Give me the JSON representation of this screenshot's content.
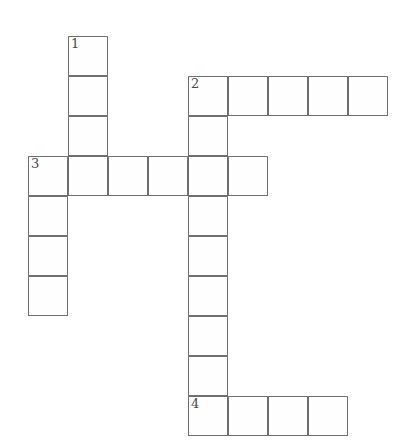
{
  "puzzle": {
    "title": "Crossword Puzzle Grid",
    "grid": {
      "cell_size": 40,
      "origin_x": 28,
      "origin_y": 36,
      "columns": 10,
      "rows": 10,
      "line_color": "#6f6f6f",
      "cell_fill": "#fefefe",
      "number_color": "#4a4a4a",
      "background": "#ffffff"
    },
    "entries": [
      {
        "number": "1",
        "direction": "down",
        "start_col": 1,
        "start_row": 0,
        "length": 4,
        "label": "1 Down"
      },
      {
        "number": "2",
        "direction": "across",
        "start_col": 4,
        "start_row": 1,
        "length": 5,
        "label": "2 Across"
      },
      {
        "number": "2",
        "direction": "down",
        "start_col": 4,
        "start_row": 1,
        "length": 9,
        "label": "2 Down"
      },
      {
        "number": "3",
        "direction": "across",
        "start_col": 0,
        "start_row": 3,
        "length": 6,
        "label": "3 Across"
      },
      {
        "number": "3",
        "direction": "down",
        "start_col": 0,
        "start_row": 3,
        "length": 4,
        "label": "3 Down"
      },
      {
        "number": "4",
        "direction": "across",
        "start_col": 4,
        "start_row": 9,
        "length": 4,
        "label": "4 Across"
      }
    ],
    "cells": [
      {
        "col": 1,
        "row": 0,
        "number": "1"
      },
      {
        "col": 1,
        "row": 1,
        "number": ""
      },
      {
        "col": 1,
        "row": 2,
        "number": ""
      },
      {
        "col": 1,
        "row": 3,
        "number": ""
      },
      {
        "col": 4,
        "row": 1,
        "number": "2"
      },
      {
        "col": 5,
        "row": 1,
        "number": ""
      },
      {
        "col": 6,
        "row": 1,
        "number": ""
      },
      {
        "col": 7,
        "row": 1,
        "number": ""
      },
      {
        "col": 8,
        "row": 1,
        "number": ""
      },
      {
        "col": 4,
        "row": 2,
        "number": ""
      },
      {
        "col": 0,
        "row": 3,
        "number": "3"
      },
      {
        "col": 2,
        "row": 3,
        "number": ""
      },
      {
        "col": 3,
        "row": 3,
        "number": ""
      },
      {
        "col": 4,
        "row": 3,
        "number": ""
      },
      {
        "col": 5,
        "row": 3,
        "number": ""
      },
      {
        "col": 0,
        "row": 4,
        "number": ""
      },
      {
        "col": 4,
        "row": 4,
        "number": ""
      },
      {
        "col": 0,
        "row": 5,
        "number": ""
      },
      {
        "col": 4,
        "row": 5,
        "number": ""
      },
      {
        "col": 0,
        "row": 6,
        "number": ""
      },
      {
        "col": 4,
        "row": 6,
        "number": ""
      },
      {
        "col": 4,
        "row": 7,
        "number": ""
      },
      {
        "col": 4,
        "row": 8,
        "number": ""
      },
      {
        "col": 4,
        "row": 9,
        "number": "4"
      },
      {
        "col": 5,
        "row": 9,
        "number": ""
      },
      {
        "col": 6,
        "row": 9,
        "number": ""
      },
      {
        "col": 7,
        "row": 9,
        "number": ""
      }
    ]
  }
}
